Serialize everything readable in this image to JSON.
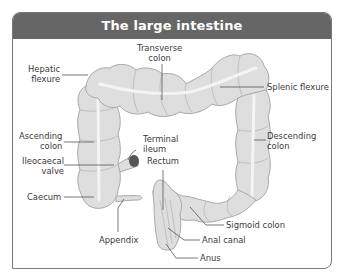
{
  "title": "The large intestine",
  "colors": {
    "header_bg": "#666666",
    "header_text": "#ffffff",
    "border": "#7a7a7a",
    "tissue_fill": "#dedede",
    "tissue_outline": "#a9a9a9",
    "taenia_band": "#f2f2f2",
    "leader_line": "#555555",
    "ileum_end": "#555555",
    "label_text": "#3a3a3a"
  },
  "labels": {
    "transverse_colon": "Transverse\ncolon",
    "hepatic_flexure": "Hepatic\nflexure",
    "splenic_flexure": "Splenic flexure",
    "ascending_colon": "Ascending\ncolon",
    "descending_colon": "Descending\ncolon",
    "terminal_ileum": "Terminal\nileum",
    "ileocaecal_valve": "Ileocaecal\nvalve",
    "rectum": "Rectum",
    "caecum": "Caecum",
    "sigmoid_colon": "Sigmoid colon",
    "appendix": "Appendix",
    "anal_canal": "Anal canal",
    "anus": "Anus"
  }
}
